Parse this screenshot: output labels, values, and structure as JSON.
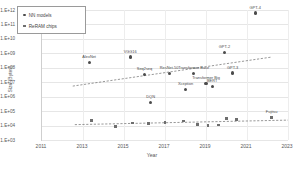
{
  "chart_data": {
    "type": "scatter",
    "title": "",
    "xlabel": "Year",
    "ylabel": "Size (Bytes)",
    "xlim": [
      2011,
      2023
    ],
    "ylim": [
      1000,
      1000000000000
    ],
    "yscale": "log",
    "grid": true,
    "legend_position": "upper-left-inside",
    "xticks": [
      "2011",
      "2013",
      "2015",
      "2017",
      "2019",
      "2021",
      "2023"
    ],
    "yticks": [
      "1.E+12",
      "1.E+11",
      "1.E+10",
      "1.E+09",
      "1.E+08",
      "1.E+07",
      "1.E+06",
      "1.E+05",
      "1.E+04",
      "1.E+03"
    ],
    "series": [
      {
        "name": "NN models",
        "marker": "circle",
        "color": "#4b4b4b",
        "trendline": "dashed-rising",
        "points": [
          {
            "label": "AlexNet",
            "x": 2013.3,
            "y": 240000000
          },
          {
            "label": "VGG16",
            "x": 2015.3,
            "y": 550000000
          },
          {
            "label": "Seq2seq",
            "x": 2016.0,
            "y": 33000000
          },
          {
            "label": "DQN",
            "x": 2016.3,
            "y": 420000
          },
          {
            "label": "ResNet-50",
            "x": 2017.2,
            "y": 40000000
          },
          {
            "label": "Xception",
            "x": 2018.0,
            "y": 3300000
          },
          {
            "label": "Transformer Base",
            "x": 2018.4,
            "y": 42000000
          },
          {
            "label": "Transformer Big",
            "x": 2019.0,
            "y": 8600000
          },
          {
            "label": "BERT",
            "x": 2019.3,
            "y": 5200000
          },
          {
            "label": "GPT-2",
            "x": 2019.9,
            "y": 1100000000
          },
          {
            "label": "GPT-3",
            "x": 2020.3,
            "y": 43000000
          },
          {
            "label": "GPT-4",
            "x": 2021.4,
            "y": 620000000000
          }
        ]
      },
      {
        "name": "ReRAM chips",
        "marker": "square",
        "color": "#6e6e6e",
        "trendline": "dashed-flat",
        "points": [
          {
            "label": "",
            "x": 2013.4,
            "y": 22000
          },
          {
            "label": "",
            "x": 2014.6,
            "y": 9000
          },
          {
            "label": "",
            "x": 2015.4,
            "y": 15000
          },
          {
            "label": "",
            "x": 2016.2,
            "y": 14000
          },
          {
            "label": "",
            "x": 2017.0,
            "y": 16000
          },
          {
            "label": "",
            "x": 2017.9,
            "y": 21000
          },
          {
            "label": "",
            "x": 2018.6,
            "y": 12000
          },
          {
            "label": "",
            "x": 2019.1,
            "y": 9500
          },
          {
            "label": "",
            "x": 2019.6,
            "y": 11000
          },
          {
            "label": "",
            "x": 2020.0,
            "y": 30000
          },
          {
            "label": "",
            "x": 2020.5,
            "y": 26000
          },
          {
            "label": "Fujitsu",
            "x": 2022.2,
            "y": 34000
          }
        ]
      }
    ]
  },
  "legend": {
    "items": [
      {
        "label": "NN models",
        "marker": "circle"
      },
      {
        "label": "ReRAM chips",
        "marker": "square"
      }
    ]
  }
}
